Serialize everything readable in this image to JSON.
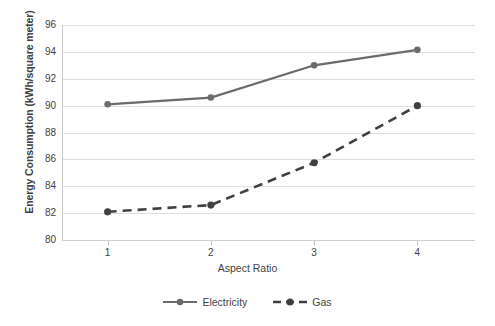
{
  "chart_data": {
    "type": "line",
    "title": "",
    "xlabel": "Aspect Ratio",
    "ylabel": "Energy Consumption (kWh/square meter)",
    "categories": [
      "1",
      "2",
      "3",
      "4"
    ],
    "x": [
      1,
      2,
      3,
      4
    ],
    "series": [
      {
        "name": "Electricity",
        "values": [
          90.1,
          90.6,
          93.0,
          94.15
        ],
        "color": "#6b6b6b",
        "linestyle": "solid",
        "marker": "circle"
      },
      {
        "name": "Gas",
        "values": [
          82.1,
          82.6,
          85.75,
          90.0
        ],
        "color": "#404040",
        "linestyle": "dashed",
        "marker": "circle"
      }
    ],
    "ylim": [
      80,
      96
    ],
    "yticks": [
      80,
      82,
      84,
      86,
      88,
      90,
      92,
      94,
      96
    ],
    "ytick_labels": [
      "80",
      "82",
      "84",
      "86",
      "88",
      "90",
      "92",
      "94",
      "96"
    ],
    "xtick_labels": [
      "1",
      "2",
      "3",
      "4"
    ],
    "grid": "horizontal",
    "legend_position": "bottom",
    "background_color": "#ffffff",
    "gridline_color": "#dedede"
  },
  "axes": {
    "y_title": "Energy Consumption (kWh/square meter)",
    "x_title": "Aspect Ratio"
  },
  "legend": {
    "items": [
      {
        "label": "Electricity"
      },
      {
        "label": "Gas"
      }
    ]
  }
}
